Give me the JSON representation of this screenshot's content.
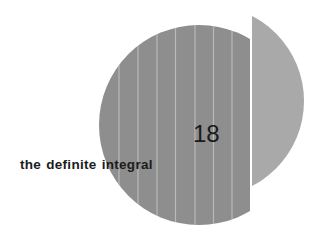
{
  "chapter": {
    "number": "18",
    "title": "the definite integral"
  },
  "graphic": {
    "main_disc_color": "#8e8e8e",
    "stripe_color": "#b9b9b9",
    "side_segment_color": "#a9a9a9",
    "background": "#ffffff"
  }
}
